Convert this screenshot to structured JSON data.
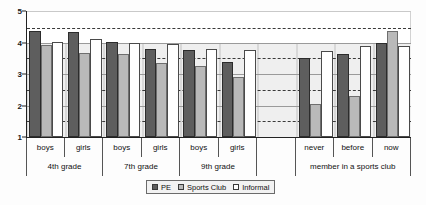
{
  "chart_data": {
    "type": "bar",
    "title": "",
    "subtitle": "",
    "xlabel": "",
    "ylabel": "",
    "ylim": [
      1,
      5
    ],
    "yticks": [
      1,
      2,
      3,
      4,
      5
    ],
    "ytick_labels": [
      "1",
      "2",
      "3",
      "4",
      "5"
    ],
    "grid": true,
    "gridlines_solid": [
      2,
      3,
      4
    ],
    "gridlines_dashed": [
      1.5,
      2.5,
      3.5,
      4.45
    ],
    "legend_position": "bottom",
    "categories": [
      "boys",
      "girls",
      "boys",
      "girls",
      "boys",
      "girls",
      "",
      "never",
      "before",
      "now"
    ],
    "series": [
      {
        "name": "PE",
        "color": "#5e5e5e",
        "values": [
          4.35,
          4.32,
          4.02,
          3.78,
          3.76,
          3.38,
          null,
          3.51,
          3.65,
          4.0
        ]
      },
      {
        "name": "Sports Club",
        "color": "#b9b9b9",
        "values": [
          3.92,
          3.68,
          3.65,
          3.35,
          3.27,
          2.9,
          null,
          2.05,
          2.29,
          4.37
        ]
      },
      {
        "name": "Informal",
        "color": "#ffffff",
        "values": [
          4.02,
          4.12,
          4.0,
          3.96,
          3.81,
          3.76,
          null,
          3.74,
          3.9,
          3.9
        ]
      }
    ],
    "group_labels_level1": [
      "boys",
      "girls",
      "boys",
      "girls",
      "boys",
      "girls",
      "",
      "never",
      "before",
      "now"
    ],
    "group_labels_level2": [
      "4th grade",
      "7th grade",
      "9th grade",
      "",
      "member in a sports club"
    ],
    "legend_entries": [
      "PE",
      "Sports Club",
      "Informal"
    ]
  },
  "axis": {
    "y_labels": [
      "5",
      "4",
      "3",
      "2",
      "1"
    ]
  },
  "bands": {
    "level1": [
      {
        "label": "boys"
      },
      {
        "label": "girls"
      },
      {
        "label": "boys"
      },
      {
        "label": "girls"
      },
      {
        "label": "boys"
      },
      {
        "label": "girls"
      },
      {
        "label": ""
      },
      {
        "label": "never"
      },
      {
        "label": "before"
      },
      {
        "label": "now"
      }
    ],
    "level2": [
      {
        "label": "4th grade",
        "span": 2
      },
      {
        "label": "7th grade",
        "span": 2
      },
      {
        "label": "9th grade",
        "span": 2
      },
      {
        "label": "",
        "span": 1
      },
      {
        "label": "member in a sports club",
        "span": 3
      }
    ]
  },
  "legend": {
    "items": [
      {
        "label": "PE",
        "key": "pe"
      },
      {
        "label": "Sports Club",
        "key": "club"
      },
      {
        "label": "Informal",
        "key": "informal"
      }
    ]
  }
}
